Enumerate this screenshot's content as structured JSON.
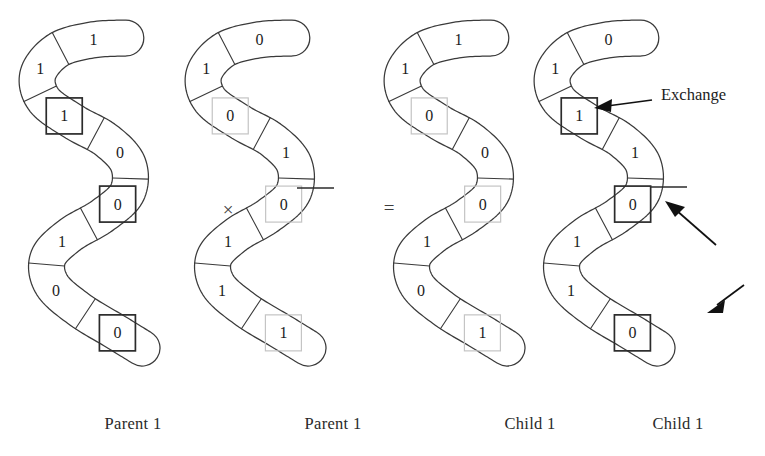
{
  "figure": {
    "background_color": "#ffffff",
    "ink_color": "#2b2b2b",
    "highlight_dark_color": "#2b2b2b",
    "highlight_light_color": "#c4c4c4"
  },
  "operators": {
    "times": "×",
    "equals": "="
  },
  "annotations": {
    "exchange_label": "Exchange"
  },
  "captions": {
    "parent1_a": "Parent 1",
    "parent1_b": "Parent 1",
    "child1_a": "Child 1",
    "child1_b": "Child 1"
  },
  "chromosomes": [
    {
      "id": "parent-1-a",
      "caption": "Parent 1",
      "role": "parent",
      "bits": [
        "1",
        "1",
        "1",
        "0",
        "0",
        "1",
        "0",
        "0"
      ],
      "highlights": [
        {
          "index": 2,
          "style": "dark"
        },
        {
          "index": 4,
          "style": "dark"
        },
        {
          "index": 7,
          "style": "dark"
        }
      ]
    },
    {
      "id": "parent-1-b",
      "caption": "Parent 1",
      "role": "parent",
      "bits": [
        "0",
        "1",
        "0",
        "1",
        "0",
        "1",
        "1",
        "1"
      ],
      "highlights": [
        {
          "index": 2,
          "style": "light"
        },
        {
          "index": 4,
          "style": "light"
        },
        {
          "index": 7,
          "style": "light"
        }
      ]
    },
    {
      "id": "child-1-a",
      "caption": "Child 1",
      "role": "child",
      "bits": [
        "1",
        "1",
        "0",
        "0",
        "0",
        "1",
        "0",
        "1"
      ],
      "highlights": [
        {
          "index": 2,
          "style": "light"
        },
        {
          "index": 4,
          "style": "light"
        },
        {
          "index": 7,
          "style": "light"
        }
      ]
    },
    {
      "id": "child-1-b",
      "caption": "Child 1",
      "role": "child",
      "bits": [
        "0",
        "1",
        "1",
        "1",
        "0",
        "1",
        "1",
        "0"
      ],
      "highlights": [
        {
          "index": 2,
          "style": "dark"
        },
        {
          "index": 4,
          "style": "dark"
        },
        {
          "index": 7,
          "style": "dark"
        }
      ]
    }
  ],
  "arrows": [
    {
      "name": "exchange-arrow-top",
      "points_to": "child-1-b gene 3",
      "direction": "left"
    },
    {
      "name": "exchange-arrow-middle",
      "points_to": "child-1-b gene 5",
      "direction": "up-left"
    },
    {
      "name": "exchange-arrow-bottom",
      "points_to": "child-1-b gene 8",
      "direction": "down-left"
    }
  ]
}
